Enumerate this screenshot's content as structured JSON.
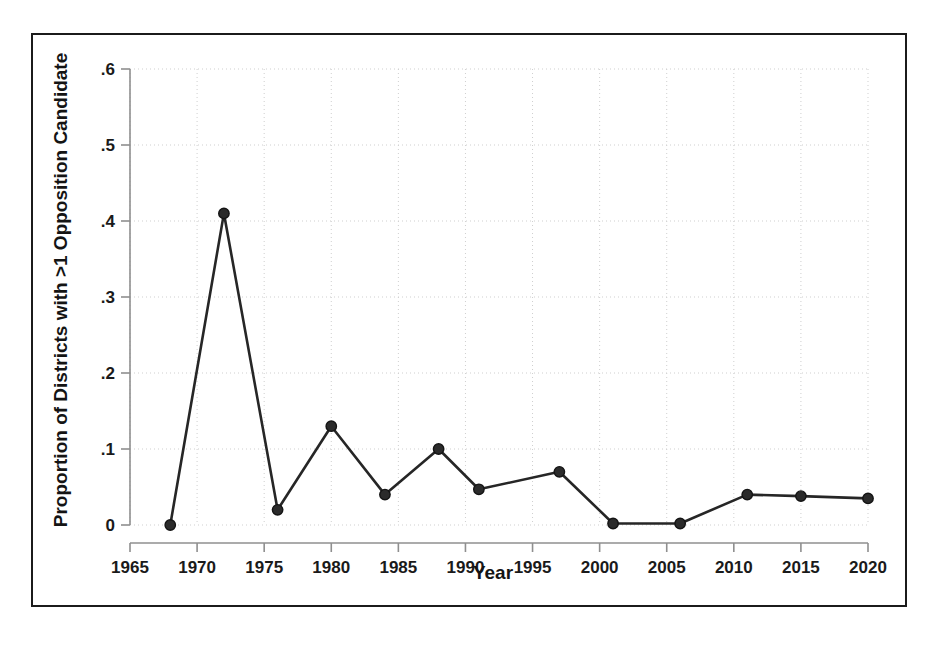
{
  "figure": {
    "background_color": "#ffffff",
    "frame_color": "#1b1b1b",
    "line_color": "#262626",
    "marker_color": "#2b2b2b",
    "grid_color": "#cfcfcf",
    "axis_color": "#8f8f8f"
  },
  "chart_data": {
    "type": "line",
    "title": "",
    "xlabel": "Year",
    "ylabel": "Proportion of Districts with >1 Opposition Candidate",
    "xlim": [
      1965,
      2020
    ],
    "ylim": [
      0,
      0.6
    ],
    "grid": true,
    "legend": "none",
    "xticks": [
      1965,
      1970,
      1975,
      1980,
      1985,
      1990,
      1995,
      2000,
      2005,
      2010,
      2015,
      2020
    ],
    "xtick_labels": [
      "1965",
      "1970",
      "1975",
      "1980",
      "1985",
      "1990",
      "1995",
      "2000",
      "2005",
      "2010",
      "2015",
      "2020"
    ],
    "yticks": [
      0,
      0.1,
      0.2,
      0.3,
      0.4,
      0.5,
      0.6
    ],
    "ytick_labels": [
      "0",
      ".1",
      ".2",
      ".3",
      ".4",
      ".5",
      ".6"
    ],
    "x": [
      1968,
      1972,
      1976,
      1980,
      1984,
      1988,
      1991,
      1997,
      2001,
      2006,
      2011,
      2015,
      2020
    ],
    "values": [
      0.0,
      0.41,
      0.02,
      0.13,
      0.04,
      0.1,
      0.047,
      0.07,
      0.002,
      0.002,
      0.04,
      0.038,
      0.035
    ],
    "series": [
      {
        "name": "Proportion of Districts with >1 Opposition Candidate",
        "points": [
          {
            "x": 1968,
            "y": 0.0
          },
          {
            "x": 1972,
            "y": 0.41
          },
          {
            "x": 1976,
            "y": 0.02
          },
          {
            "x": 1980,
            "y": 0.13
          },
          {
            "x": 1984,
            "y": 0.04
          },
          {
            "x": 1988,
            "y": 0.1
          },
          {
            "x": 1991,
            "y": 0.047
          },
          {
            "x": 1997,
            "y": 0.07
          },
          {
            "x": 2001,
            "y": 0.002
          },
          {
            "x": 2006,
            "y": 0.002
          },
          {
            "x": 2011,
            "y": 0.04
          },
          {
            "x": 2015,
            "y": 0.038
          },
          {
            "x": 2020,
            "y": 0.035
          }
        ]
      }
    ]
  }
}
